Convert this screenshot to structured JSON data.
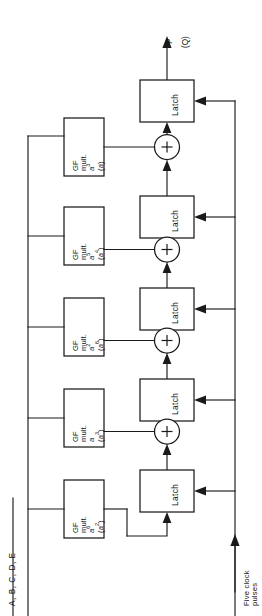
{
  "figure": {
    "kind": "block-diagram",
    "title_text": ""
  },
  "output": {
    "primary_label": "P",
    "secondary_label": "(Q)"
  },
  "input": {
    "bus_label": "A, B, C, D, E"
  },
  "clock": {
    "label_line1": "Five clock",
    "label_line2": "pulses"
  },
  "latches": [
    {
      "id": "latch-1",
      "label": "Latch"
    },
    {
      "id": "latch-2",
      "label": "Latch"
    },
    {
      "id": "latch-3",
      "label": "Latch"
    },
    {
      "id": "latch-4",
      "label": "Latch"
    },
    {
      "id": "latch-5",
      "label": "Latch"
    }
  ],
  "adders": [
    {
      "id": "adder-1",
      "symbol": "+"
    },
    {
      "id": "adder-2",
      "symbol": "+"
    },
    {
      "id": "adder-3",
      "symbol": "+"
    },
    {
      "id": "adder-4",
      "symbol": "+"
    }
  ],
  "multipliers": [
    {
      "id": "gf-mult-1",
      "line1": "GF",
      "line2": "mult.",
      "coefficient": "a",
      "coefficient_exponent": "3",
      "alternate": "(a)",
      "alternate_base": "a",
      "alternate_exponent": ""
    },
    {
      "id": "gf-mult-2",
      "line1": "GF",
      "line2": "mult.",
      "coefficient": "a",
      "coefficient_exponent": "5",
      "alternate": "(a4)",
      "alternate_base": "a",
      "alternate_exponent": "4"
    },
    {
      "id": "gf-mult-3",
      "line1": "GF",
      "line2": "mult.",
      "coefficient": "a",
      "coefficient_exponent": "2",
      "alternate": "(a6)",
      "alternate_base": "a",
      "alternate_exponent": "6"
    },
    {
      "id": "gf-mult-4",
      "line1": "GF",
      "line2": "mult.",
      "coefficient": "a",
      "coefficient_exponent": "",
      "alternate": "(a3)",
      "alternate_base": "a",
      "alternate_exponent": "3"
    },
    {
      "id": "gf-mult-5",
      "line1": "GF",
      "line2": "mult.",
      "coefficient": "a",
      "coefficient_exponent": "6",
      "alternate": "(a2)",
      "alternate_base": "a",
      "alternate_exponent": "2"
    }
  ],
  "colors": {
    "ink": "#1a1a1a",
    "paper": "#ffffff"
  }
}
